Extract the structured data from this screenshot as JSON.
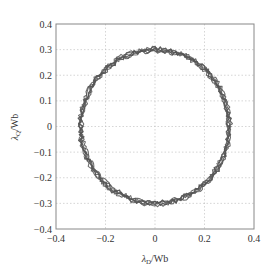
{
  "chart_data": {
    "type": "line",
    "title": "",
    "xlabel": "λD/Wb",
    "ylabel": "λQ/Wb",
    "xlim": [
      -0.4,
      0.4
    ],
    "ylim": [
      -0.4,
      0.4
    ],
    "x_ticks": [
      "-0.4",
      "-0.2",
      "0",
      "0.2",
      "0.4"
    ],
    "y_ticks": [
      "0.4",
      "0.3",
      "0.2",
      "0.1",
      "0",
      "-0.1",
      "-0.2",
      "-0.3",
      "-0.4"
    ],
    "grid": true,
    "legend": null,
    "series": [
      {
        "name": "stator flux trajectory",
        "shape": "circle",
        "center": [
          0,
          0
        ],
        "radius": 0.3,
        "ripple": 0.01,
        "turns": 6,
        "color": "#555555"
      }
    ]
  },
  "labels": {
    "xlabel_main": "λ",
    "xlabel_sub": "D",
    "xlabel_unit": "/Wb",
    "ylabel_main": "λ",
    "ylabel_sub": "Q",
    "ylabel_unit": "/Wb"
  }
}
